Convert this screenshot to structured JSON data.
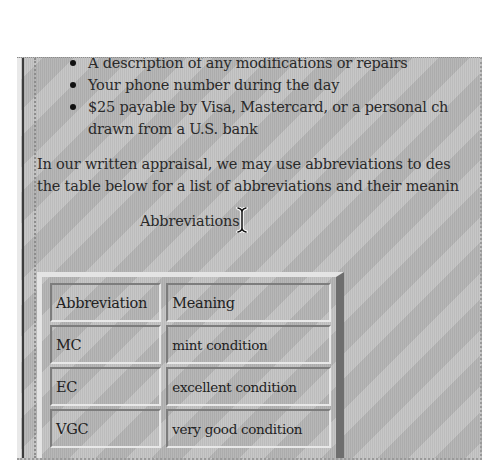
{
  "document": {
    "bullets": [
      "A description of any modifications or repairs",
      "Your phone number during the day",
      "$25 payable by Visa, Mastercard, or a personal ch",
      "drawn from a U.S. bank"
    ],
    "paragraph": {
      "line1": "In our written appraisal, we may use abbreviations to des",
      "line2": "the table below for a list of abbreviations and their meanin"
    },
    "table_caption": "Abbreviations",
    "table": {
      "headers": [
        "Abbreviation",
        "Meaning"
      ],
      "rows": [
        [
          "MC",
          "mint condition"
        ],
        [
          "EC",
          "excellent condition"
        ],
        [
          "VGC",
          "very good condition"
        ]
      ]
    }
  },
  "cursor": {
    "type": "i-beam-text-cursor"
  },
  "colors": {
    "page_background": "#bdbdbd",
    "text": "#2a2a2a",
    "bevel_light": "#e4e4e4",
    "bevel_dark": "#6e6e6e"
  }
}
